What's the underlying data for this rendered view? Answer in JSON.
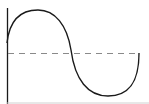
{
  "diagram": {
    "type": "sine-wave",
    "colors": {
      "curve": "#1a1a1a",
      "axis": "#1a1a1a",
      "midline": "#8a8a8a",
      "bottom_axis": "#d0d0d0"
    }
  }
}
